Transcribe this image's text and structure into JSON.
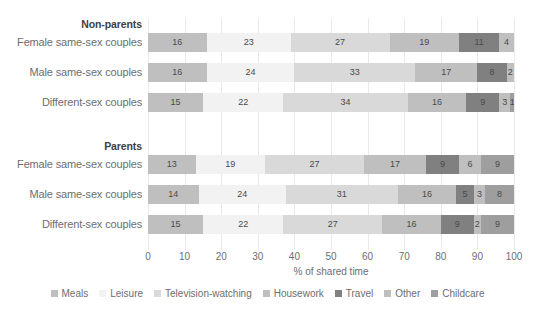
{
  "chart_data": {
    "type": "bar",
    "orientation": "horizontal",
    "stacked": true,
    "normalized_percent": true,
    "title": "",
    "subtitle": "",
    "xlabel": "% of shared time",
    "ylabel": "",
    "xlim": [
      0,
      100
    ],
    "xticks": [
      0,
      10,
      20,
      30,
      40,
      50,
      60,
      70,
      80,
      90,
      100
    ],
    "xtick_labels": [
      "0",
      "10",
      "20",
      "30",
      "40",
      "50",
      "60",
      "70",
      "80",
      "90",
      "100"
    ],
    "grid": "vertical-only",
    "legend_position": "bottom-center",
    "legend_entries": [
      "Meals",
      "Leisure",
      "Television-watching",
      "Housework",
      "Travel",
      "Other",
      "Childcare"
    ],
    "series": [
      {
        "name": "Meals",
        "color": "#bfbfbf",
        "values": [
          16,
          16,
          15,
          13,
          14,
          15
        ]
      },
      {
        "name": "Leisure",
        "color": "#f2f2f2",
        "values": [
          23,
          24,
          22,
          19,
          24,
          22
        ]
      },
      {
        "name": "Television-watching",
        "color": "#d9d9d9",
        "values": [
          27,
          33,
          34,
          27,
          31,
          27
        ]
      },
      {
        "name": "Housework",
        "color": "#bfbfbf",
        "values": [
          19,
          17,
          16,
          17,
          16,
          16
        ]
      },
      {
        "name": "Travel",
        "color": "#808080",
        "values": [
          11,
          8,
          9,
          9,
          5,
          9
        ]
      },
      {
        "name": "Other",
        "color": "#bfbfbf",
        "values": [
          4,
          2,
          3,
          6,
          3,
          2
        ]
      },
      {
        "name": "Childcare",
        "color": "#9e9e9e",
        "values": [
          0,
          0,
          1,
          9,
          8,
          9
        ]
      }
    ],
    "groups": [
      {
        "header": "Non-parents",
        "categories": [
          "Female same-sex couples",
          "Male same-sex couples",
          "Different-sex couples"
        ],
        "rows": [
          {
            "category": "Female same-sex couples",
            "values": [
              16,
              23,
              27,
              19,
              11,
              4,
              0
            ]
          },
          {
            "category": "Male same-sex couples",
            "values": [
              16,
              24,
              33,
              17,
              8,
              2,
              0
            ]
          },
          {
            "category": "Different-sex couples",
            "values": [
              15,
              22,
              34,
              16,
              9,
              3,
              1
            ]
          }
        ]
      },
      {
        "header": "Parents",
        "categories": [
          "Female same-sex couples",
          "Male same-sex couples",
          "Different-sex couples"
        ],
        "rows": [
          {
            "category": "Female same-sex couples",
            "values": [
              13,
              19,
              27,
              17,
              9,
              6,
              9
            ]
          },
          {
            "category": "Male same-sex couples",
            "values": [
              14,
              24,
              31,
              16,
              5,
              3,
              8
            ]
          },
          {
            "category": "Different-sex couples",
            "values": [
              15,
              22,
              27,
              16,
              9,
              2,
              9
            ]
          }
        ]
      }
    ]
  },
  "colors": {
    "meals": "#bfbfbf",
    "leisure": "#f2f2f2",
    "television_watching": "#d9d9d9",
    "housework": "#bfbfbf",
    "travel": "#808080",
    "other": "#bfbfbf",
    "childcare": "#9e9e9e",
    "gridline": "#e9e9e9",
    "label_text": "#6e6e6e",
    "header_text": "#404040",
    "value_text": "#4a4a4a"
  }
}
